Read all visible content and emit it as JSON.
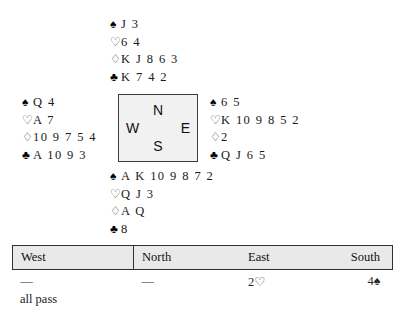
{
  "deal": {
    "hands": [
      {
        "position": "North",
        "name": "north",
        "suits": [
          {
            "suit": "spades",
            "pip": "♠",
            "filled": true,
            "cards": "J 3"
          },
          {
            "suit": "hearts",
            "pip": "♡",
            "filled": false,
            "cards": "6 4"
          },
          {
            "suit": "diamonds",
            "pip": "♢",
            "filled": false,
            "cards": "K J 8 6 3"
          },
          {
            "suit": "clubs",
            "pip": "♣",
            "filled": true,
            "cards": "K 7 4 2"
          }
        ]
      },
      {
        "position": "West",
        "name": "west",
        "suits": [
          {
            "suit": "spades",
            "pip": "♠",
            "filled": true,
            "cards": "Q 4"
          },
          {
            "suit": "hearts",
            "pip": "♡",
            "filled": false,
            "cards": "A 7"
          },
          {
            "suit": "diamonds",
            "pip": "♢",
            "filled": false,
            "cards": "10 9 7 5 4"
          },
          {
            "suit": "clubs",
            "pip": "♣",
            "filled": true,
            "cards": "A 10 9 3"
          }
        ]
      },
      {
        "position": "East",
        "name": "east",
        "suits": [
          {
            "suit": "spades",
            "pip": "♠",
            "filled": true,
            "cards": "6 5"
          },
          {
            "suit": "hearts",
            "pip": "♡",
            "filled": false,
            "cards": "K 10 9 8 5 2"
          },
          {
            "suit": "diamonds",
            "pip": "♢",
            "filled": false,
            "cards": "2"
          },
          {
            "suit": "clubs",
            "pip": "♣",
            "filled": true,
            "cards": "Q J 6 5"
          }
        ]
      },
      {
        "position": "South",
        "name": "south",
        "suits": [
          {
            "suit": "spades",
            "pip": "♠",
            "filled": true,
            "cards": "A K 10 9 8 7 2"
          },
          {
            "suit": "hearts",
            "pip": "♡",
            "filled": false,
            "cards": "Q J 3"
          },
          {
            "suit": "diamonds",
            "pip": "♢",
            "filled": false,
            "cards": "A Q"
          },
          {
            "suit": "clubs",
            "pip": "♣",
            "filled": true,
            "cards": "8"
          }
        ]
      }
    ],
    "compass": {
      "north": "N",
      "south": "S",
      "west": "W",
      "east": "E"
    }
  },
  "auction": {
    "headers": {
      "west": "West",
      "north": "North",
      "east": "East",
      "south": "South"
    },
    "rows": [
      {
        "west": "—",
        "north": "—",
        "east": "2♡",
        "south": "4♠"
      }
    ],
    "footer": "all pass"
  },
  "colors": {
    "ink": "#1a1a1a",
    "compass_fill": "#f1f1f1",
    "compass_border": "#3c3c3c",
    "header_fill": "#e9e9e9",
    "table_border": "#2f2f2f",
    "page_background": "#ffffff"
  }
}
